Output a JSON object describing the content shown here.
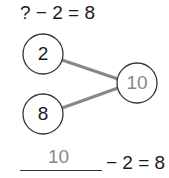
{
  "problem": {
    "equation": "? − 2 = 8"
  },
  "number_bond": {
    "parts": [
      {
        "value": "2",
        "cx": 43,
        "cy": 54
      },
      {
        "value": "8",
        "cx": 43,
        "cy": 114
      }
    ],
    "whole": {
      "value": "10",
      "cx": 137,
      "cy": 83
    },
    "line_color": "#888888",
    "circle_stroke": "#333333",
    "whole_text_color": "#888888"
  },
  "answer": {
    "filled_value": "10",
    "equation_tail": "− 2 = 8"
  }
}
